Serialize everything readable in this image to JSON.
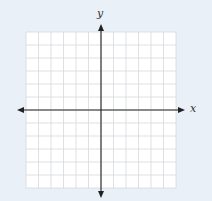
{
  "chart_data": {
    "type": "scatter",
    "title": "",
    "xlabel": "x",
    "ylabel": "y",
    "xlim": [
      -6,
      6
    ],
    "ylim": [
      -6,
      6
    ],
    "grid": true,
    "grid_columns": 12,
    "grid_rows": 12,
    "series": [],
    "axis_arrows": true
  },
  "colors": {
    "background": "#eaf0f7",
    "grid_fill": "#ffffff",
    "grid_lines": "#d6d8dc",
    "axes": "#222222"
  }
}
